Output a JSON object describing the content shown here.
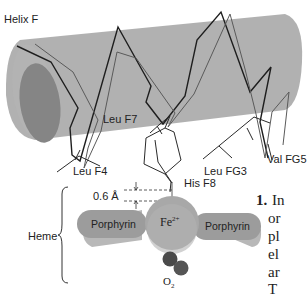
{
  "figure": {
    "helix_label": "Helix F",
    "residues": {
      "leu_f7": "Leu F7",
      "leu_f4": "Leu F4",
      "leu_fg3": "Leu FG3",
      "val_fg5": "Val FG5",
      "his_f8": "His F8"
    },
    "heme_label": "Heme",
    "distance_label": "0.6 Å",
    "porphyrin_left": "Porphyrin",
    "porphyrin_right": "Porphyrin",
    "iron_label": "Fe",
    "iron_charge": "2+",
    "oxygen_label": "O",
    "oxygen_subscript": "2"
  },
  "side_text": {
    "number": "1.",
    "lines": [
      "In",
      "or",
      "pl",
      "el",
      "ar",
      "T"
    ]
  },
  "colors": {
    "cylinder": "#a9a9a9",
    "cylinder_end": "#8a8a8a",
    "porphyrin": "#9a9a9a",
    "iron": "#a6a6a6",
    "oxygen": "#4a4a4a",
    "backbone_dark": "#1e1e1e",
    "backbone_light": "#5a5a5a"
  }
}
